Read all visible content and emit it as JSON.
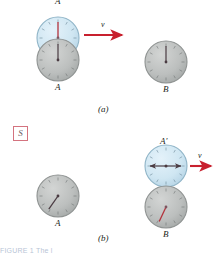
{
  "figure": {
    "title_fragment": "FIGURE 1 The l",
    "panels": [
      {
        "id": "a",
        "label": "(a)"
      },
      {
        "id": "b",
        "label": "(b)"
      }
    ],
    "frame_badge": {
      "label": "S",
      "border_color": "#d4737f",
      "text_color": "#6b5a60"
    }
  },
  "colors": {
    "moving_clock_face": "#cfe6f2",
    "moving_clock_edge": "#8fb4c7",
    "rest_clock_face": "#b9bcbb",
    "rest_clock_edge": "#8e9291",
    "hand_red": "#b3323c",
    "hand_dark": "#4a3b42",
    "tick": "#6e7372",
    "arrow": "#c8202e",
    "text": "#231f20"
  },
  "panel_a": {
    "caption": "(a)",
    "clocks": [
      {
        "name": "moving-clock-a-top",
        "label": "A",
        "label_position": "above",
        "state": "moving",
        "face": "blue",
        "hand_angle_deg": 0,
        "hand_color": "#b3323c",
        "cx": 58,
        "cy": 38,
        "r": 21
      },
      {
        "name": "rest-clock-a",
        "label": "A",
        "label_position": "below",
        "state": "rest",
        "face": "gray",
        "hand_angle_deg": 0,
        "hand_color": "#4a3b42",
        "cx": 58,
        "cy": 60,
        "r": 21
      },
      {
        "name": "rest-clock-b",
        "label": "B",
        "label_position": "below",
        "state": "rest",
        "face": "gray",
        "hand_angle_deg": 0,
        "hand_color": "#4a3b42",
        "cx": 166,
        "cy": 62,
        "r": 21
      }
    ],
    "velocity_arrow": {
      "label": "v",
      "x": 86,
      "y": 35,
      "length": 40,
      "direction": "right"
    }
  },
  "panel_b": {
    "caption": "(b)",
    "clocks": [
      {
        "name": "moving-clock-a-prime",
        "label": "A'",
        "label_position": "above",
        "state": "moving",
        "face": "blue",
        "hand_angle_deg": 270,
        "hand_color": "#4a3b42",
        "cx": 166,
        "cy": 166,
        "r": 21
      },
      {
        "name": "rest-clock-a-bottom",
        "label": "A",
        "label_position": "below",
        "state": "rest",
        "face": "gray",
        "hand_angle_deg": 215,
        "hand_color": "#4a3b42",
        "cx": 58,
        "cy": 196,
        "r": 21
      },
      {
        "name": "rest-clock-b-bottom",
        "label": "B",
        "label_position": "below",
        "state": "rest",
        "face": "gray",
        "hand_angle_deg": 205,
        "hand_color": "#b3323c",
        "cx": 166,
        "cy": 207,
        "r": 21
      }
    ],
    "velocity_arrow": {
      "label": "v",
      "x": 192,
      "y": 163,
      "length": 20,
      "direction": "right"
    }
  }
}
